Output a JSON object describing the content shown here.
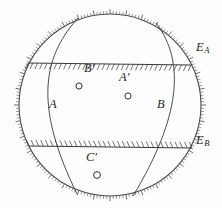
{
  "figure": {
    "background_color": "#fdfdfd",
    "ink_color": "#3a3a3a",
    "label_color": "#262626",
    "outer_circle": {
      "center_x": 110,
      "center_y": 105,
      "radius": 91,
      "graduation_ticks": 180,
      "tick_direction": "outward"
    },
    "hatched_lines": [
      {
        "name": "line-to-EA",
        "from_x": 28,
        "from_y": 63,
        "to_x": 191,
        "to_y": 65,
        "hatch_side": "below",
        "hatch_count": 34
      },
      {
        "name": "line-to-EB",
        "from_x": 29,
        "from_y": 146,
        "to_x": 192,
        "to_y": 148,
        "hatch_side": "above",
        "hatch_count": 34
      }
    ],
    "arcs": [
      {
        "name": "arc-A",
        "start_x": 78,
        "start_y": 18,
        "end_x": 133,
        "end_y": 196
      },
      {
        "name": "arc-B",
        "start_x": 156,
        "start_y": 23,
        "end_x": 77,
        "end_y": 194
      }
    ],
    "points": [
      {
        "id": "B-prime",
        "label": "B",
        "prime": true,
        "marker_x": 79,
        "marker_y": 86,
        "label_x": 88,
        "label_y": 70
      },
      {
        "id": "A-prime",
        "label": "A",
        "prime": true,
        "marker_x": 128,
        "marker_y": 96,
        "label_x": 123,
        "label_y": 78
      },
      {
        "id": "C-prime",
        "label": "C",
        "prime": true,
        "marker_x": 97,
        "marker_y": 175,
        "label_x": 89,
        "label_y": 158
      }
    ],
    "labels": [
      {
        "id": "label-A",
        "text": "A",
        "sub": "",
        "x": 51,
        "y": 98
      },
      {
        "id": "label-B",
        "text": "B",
        "sub": "",
        "x": 159,
        "y": 98
      },
      {
        "id": "label-EA",
        "text": "E",
        "sub": "A",
        "x": 198,
        "y": 47
      },
      {
        "id": "label-EB",
        "text": "E",
        "sub": "B",
        "x": 198,
        "y": 140
      }
    ]
  }
}
